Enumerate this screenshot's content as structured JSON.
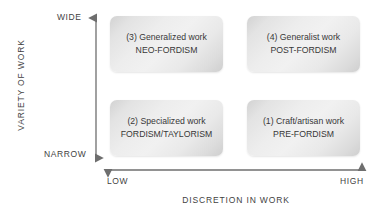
{
  "diagram": {
    "y_axis": {
      "title": "VARIETY OF WORK",
      "high_label": "WIDE",
      "low_label": "NARROW"
    },
    "x_axis": {
      "title": "DISCRETION IN WORK",
      "low_label": "LOW",
      "high_label": "HIGH"
    },
    "quadrants": [
      {
        "id": "q3",
        "line1": "(3) Generalized work",
        "line2": "NEO-FORDISM"
      },
      {
        "id": "q4",
        "line1": "(4) Generalist work",
        "line2": "POST-FORDISM"
      },
      {
        "id": "q2",
        "line1": "(2) Specialized work",
        "line2": "FORDISM/TAYLORISM"
      },
      {
        "id": "q1",
        "line1": "(1) Craft/artisan work",
        "line2": "PRE-FORDISM"
      }
    ],
    "colors": {
      "text": "#383838",
      "axis": "#6e6e6e",
      "box_light": "#f1f1f1",
      "box_dark": "#cfcfcf",
      "background": "#ffffff"
    }
  }
}
